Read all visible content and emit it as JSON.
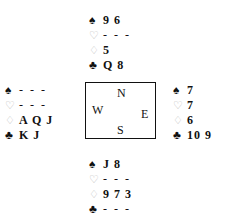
{
  "suits": {
    "spades": "♠",
    "hearts": "♡",
    "diamonds": "♢",
    "clubs": "♣"
  },
  "compass": {
    "north": "N",
    "south": "S",
    "east": "E",
    "west": "W"
  },
  "hands": {
    "north": {
      "spades": "9 6",
      "hearts": "- - -",
      "diamonds": "5",
      "clubs": "Q 8"
    },
    "west": {
      "spades": "- - -",
      "hearts": "- - -",
      "diamonds": "A Q J",
      "clubs": "K J"
    },
    "east": {
      "spades": "7",
      "hearts": "7",
      "diamonds": "6",
      "clubs": "10 9"
    },
    "south": {
      "spades": "J 8",
      "hearts": "- - -",
      "diamonds": "9 7 3",
      "clubs": "- - -"
    }
  }
}
